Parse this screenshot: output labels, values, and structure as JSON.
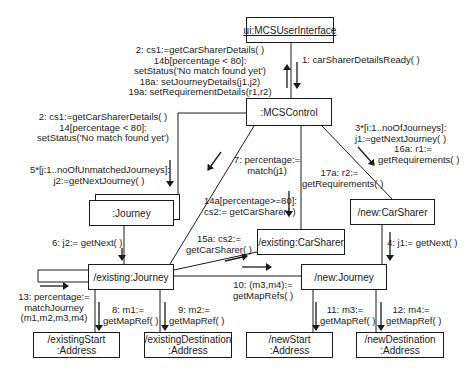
{
  "objects": {
    "ui": "ui:MCSUserInterface",
    "control": ":MCSControl",
    "journey_multi": ":Journey",
    "new_carsharer": "/new:CarSharer",
    "existing_carsharer": "/existing:CarSharer",
    "existing_journey": "/existing:Journey",
    "new_journey": "/new:Journey",
    "existing_start": [
      "/existingStart",
      ":Address"
    ],
    "existing_destination": [
      "/existingDestination",
      ":Address"
    ],
    "new_start": [
      "/newStart",
      ":Address"
    ],
    "new_destination": [
      "/newDestination",
      ":Address"
    ]
  },
  "messages": {
    "m1": "1: carSharerDetailsReady( )",
    "ui_return": [
      "2: cs1:=getCarSharerDetails( )",
      "14b[percentage < 80]:",
      "setStatus('No match found yet')",
      "18a: setJourneyDetails(j1,j2)",
      "19a: setRequirementDetails(r1,r2)"
    ],
    "to_journey_multi_top": [
      "2: cs1:=getCarSharerDetails( )",
      "14[percentage < 80]:",
      "setStatus('No match found yet')"
    ],
    "m5": [
      "5*[j:1..noOfUnmatchedJourneys]:",
      "j2:=getNextJourney( )"
    ],
    "m3": [
      "3*[i:1..noOfJourneys]:",
      "j1:=getNextJourney( )"
    ],
    "m16a": [
      "16a: r1:=",
      "getRequirements( )"
    ],
    "m17a": [
      "17a: r2:=",
      "getRequirements( )"
    ],
    "m7": [
      "7: percentage:=",
      "match(j1)"
    ],
    "m14a": [
      "14a[percentage>=80]:",
      "cs2:= getCarSharer( )"
    ],
    "m15a": [
      "15a: cs2:=",
      "getCarSharer( )"
    ],
    "m6": "6: j2:= getNext( )",
    "m4": "4: j1:= getNext( )",
    "m10": [
      "10: (m3,m4):=",
      "getMapRefs( )"
    ],
    "m13": [
      "13: percentage:=",
      "matchJourney",
      "(m1,m2,m3,m4)"
    ],
    "m8": [
      "8: m1:=",
      "getMapRef( )"
    ],
    "m9": [
      "9: m2:=",
      "getMapRef( )"
    ],
    "m11": [
      "11: m3:=",
      "getMapRef( )"
    ],
    "m12": [
      "12: m4:=",
      "getMapRef( )"
    ]
  }
}
